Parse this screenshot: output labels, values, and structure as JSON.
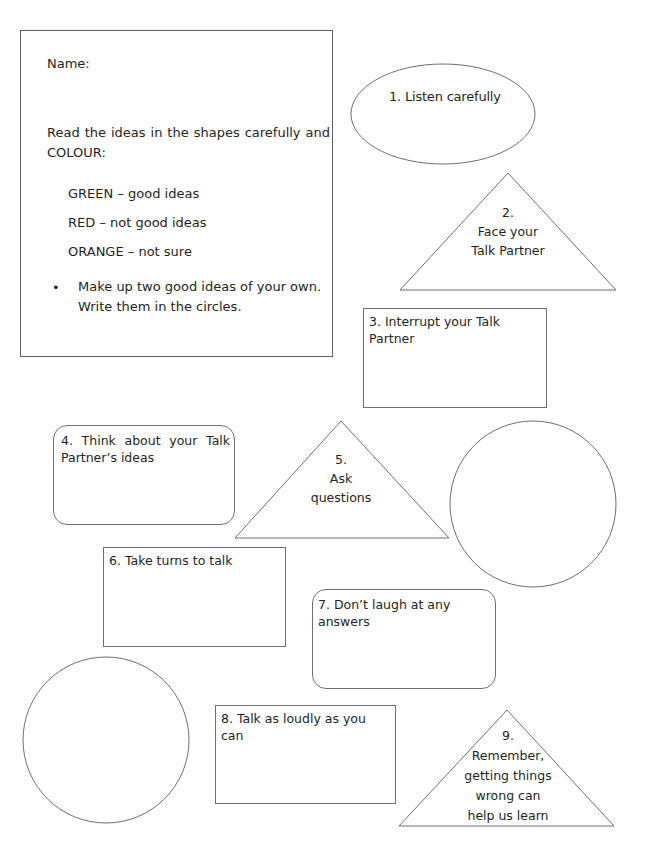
{
  "instructions": {
    "name_label": "Name:",
    "intro": "Read the ideas in the shapes carefully and COLOUR:",
    "legend": [
      {
        "colour": "GREEN",
        "meaning": "GREEN – good ideas"
      },
      {
        "colour": "RED",
        "meaning": "RED – not good ideas"
      },
      {
        "colour": "ORANGE",
        "meaning": "ORANGE – not sure"
      }
    ],
    "bullet_symbol": "•",
    "bullet_text": "Make up two good ideas of your own. Write them in the circles."
  },
  "ideas": [
    {
      "number": 1,
      "shape": "ellipse",
      "text": "1. Listen carefully"
    },
    {
      "number": 2,
      "shape": "triangle",
      "lines": [
        "2.",
        "Face your",
        "Talk Partner"
      ]
    },
    {
      "number": 3,
      "shape": "rectangle",
      "text": "3. Interrupt your Talk Partner"
    },
    {
      "number": 4,
      "shape": "rounded-rectangle",
      "text": "4. Think about your Talk Partner’s ideas"
    },
    {
      "number": 5,
      "shape": "triangle",
      "lines": [
        "5.",
        "Ask",
        "questions"
      ]
    },
    {
      "number": 6,
      "shape": "rectangle",
      "text": "6. Take turns to talk"
    },
    {
      "number": 7,
      "shape": "rounded-rectangle",
      "text": "7. Don’t laugh at any answers"
    },
    {
      "number": 8,
      "shape": "rectangle",
      "text": "8. Talk as loudly as you can"
    },
    {
      "number": 9,
      "shape": "triangle",
      "lines": [
        "9.",
        "Remember,",
        "getting things",
        "wrong can",
        "help us learn"
      ]
    }
  ],
  "blank_circles": [
    {
      "label": "own-idea-circle-1"
    },
    {
      "label": "own-idea-circle-2"
    }
  ],
  "colors": {
    "stroke": "#6d6e71",
    "text": "#231f20",
    "background": "#ffffff"
  }
}
